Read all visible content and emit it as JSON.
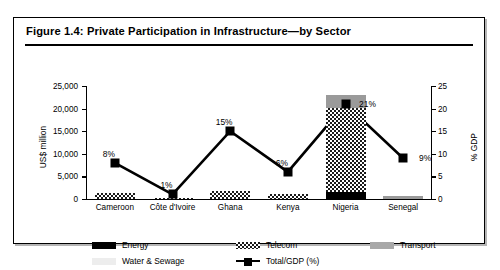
{
  "figure": {
    "title": "Figure 1.4: Private Participation in Infrastructure—by Sector"
  },
  "chart_data": {
    "type": "bar",
    "title": "Figure 1.4: Private Participation in Infrastructure—by Sector",
    "xlabel": "",
    "ylabel": "US$ million",
    "y2label": "% GDP",
    "ylim": [
      0,
      25000
    ],
    "y2lim": [
      0,
      25
    ],
    "yticks": [
      "0",
      "5,000",
      "10,000",
      "15,000",
      "20,000",
      "25,000"
    ],
    "y2ticks": [
      "0",
      "5",
      "10",
      "15",
      "20",
      "25"
    ],
    "grid": false,
    "legend_position": "bottom",
    "categories": [
      "Cameroon",
      "Côte d'Ivoire",
      "Ghana",
      "Kenya",
      "Nigeria",
      "Senegal"
    ],
    "series": [
      {
        "name": "Energy",
        "values": [
          0,
          0,
          0,
          0,
          1600,
          0
        ]
      },
      {
        "name": "Telecom",
        "values": [
          1350,
          200,
          1800,
          1150,
          18600,
          0
        ]
      },
      {
        "name": "Transport",
        "values": [
          0,
          0,
          0,
          0,
          2900,
          700
        ]
      },
      {
        "name": "Water & Sewage",
        "values": [
          0,
          0,
          0,
          0,
          0,
          0
        ]
      }
    ],
    "totals": [
      1350,
      200,
      1800,
      1150,
      23100,
      700
    ],
    "line_series": {
      "name": "Total/GDP (%)",
      "values": [
        8,
        1,
        15,
        6,
        21,
        9
      ],
      "labels": [
        "8%",
        "1%",
        "15%",
        "6%",
        "21%",
        "9%"
      ]
    },
    "colors": {
      "energy": "#000000",
      "telecom": "#1a1a1a",
      "transport": "#9a9a9a",
      "water": "#e2e2e2",
      "line": "#000000"
    }
  },
  "legend": {
    "items": [
      {
        "label": "Energy",
        "swatch": "energy-swatch"
      },
      {
        "label": "Telecom",
        "swatch": "telecom-swatch"
      },
      {
        "label": "Transport",
        "swatch": "transport-swatch"
      },
      {
        "label": "Water & Sewage",
        "swatch": "water-swatch"
      },
      {
        "label": "Total/GDP (%)",
        "swatch": "line-swatch"
      }
    ]
  }
}
